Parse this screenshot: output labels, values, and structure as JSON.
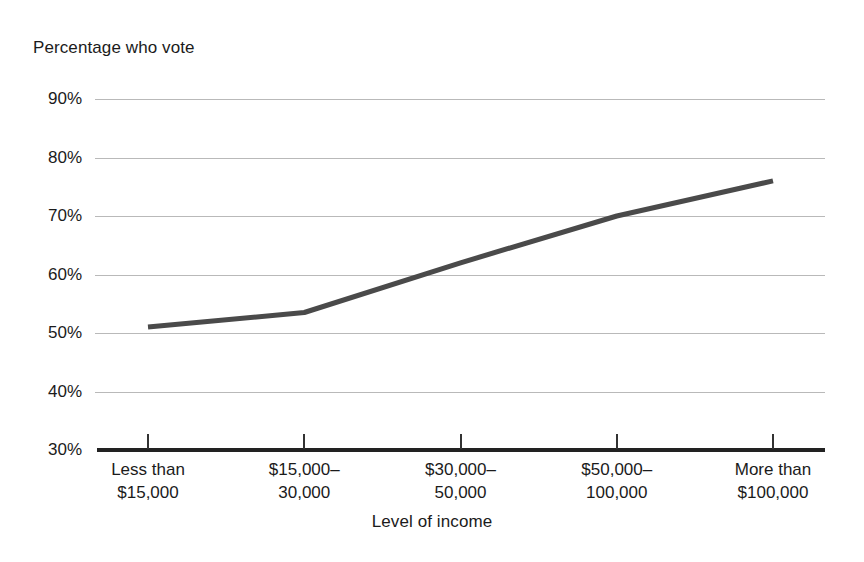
{
  "chart_data": {
    "type": "line",
    "title": "",
    "ylabel": "Percentage who vote",
    "xlabel": "Level of income",
    "categories": [
      "Less than $15,000",
      "$15,000–30,000",
      "$30,000–50,000",
      "$50,000–100,000",
      "More than $100,000"
    ],
    "category_lines": [
      {
        "line1": "Less than",
        "line2": "$15,000"
      },
      {
        "line1": "$15,000–",
        "line2": "30,000"
      },
      {
        "line1": "$30,000–",
        "line2": "50,000"
      },
      {
        "line1": "$50,000–",
        "line2": "100,000"
      },
      {
        "line1": "More than",
        "line2": "$100,000"
      }
    ],
    "values": [
      51,
      53.5,
      62,
      70,
      76
    ],
    "ylim": [
      30,
      90
    ],
    "ytick_values": [
      90,
      80,
      70,
      60,
      50,
      40,
      30
    ],
    "ytick_labels": [
      "90%",
      "80%",
      "70%",
      "60%",
      "50%",
      "40%",
      "30%"
    ],
    "grid": true,
    "legend": false,
    "series_color": "#4a4a4a",
    "gridline_color": "#b9b9b9",
    "axis_color": "#222222",
    "background": "#ffffff"
  },
  "axes": {
    "y_title": "Percentage who vote",
    "x_title": "Level of income"
  }
}
